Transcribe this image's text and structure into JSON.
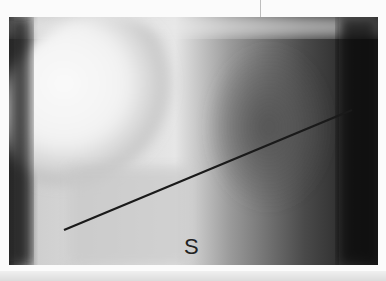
{
  "figure": {
    "label": "S",
    "line": {
      "x1": 55,
      "y1": 213,
      "x2": 343,
      "y2": 93,
      "color": "#1a1a1a"
    }
  }
}
